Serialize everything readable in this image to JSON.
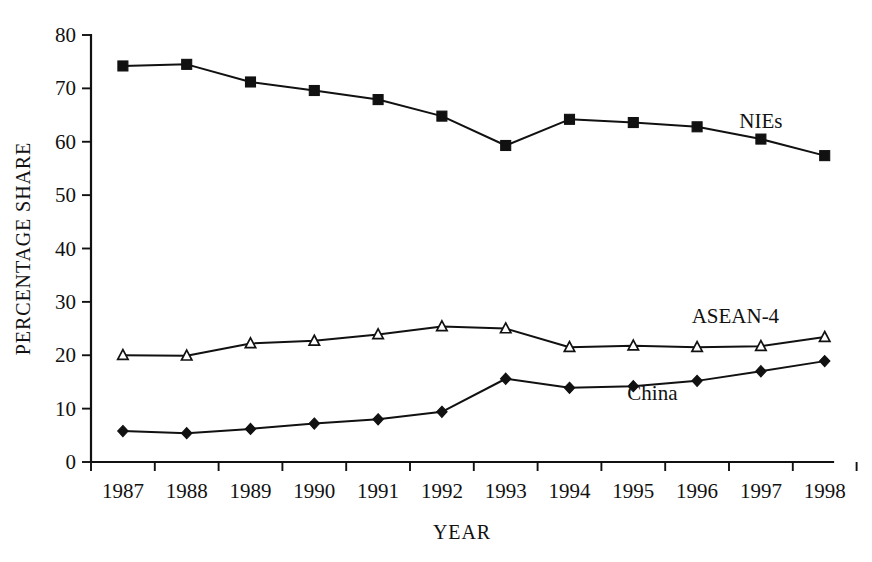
{
  "chart_data": {
    "type": "line",
    "title": "",
    "xlabel": "YEAR",
    "ylabel": "PERCENTAGE SHARE",
    "categories": [
      "1987",
      "1988",
      "1989",
      "1990",
      "1991",
      "1992",
      "1993",
      "1994",
      "1995",
      "1996",
      "1997",
      "1998"
    ],
    "x": [
      1987,
      1988,
      1989,
      1990,
      1991,
      1992,
      1993,
      1994,
      1995,
      1996,
      1997,
      1998
    ],
    "ylim": [
      0,
      80
    ],
    "yticks": [
      "0",
      "10",
      "20",
      "30",
      "40",
      "50",
      "60",
      "70",
      "80"
    ],
    "ytick_values": [
      0,
      10,
      20,
      30,
      40,
      50,
      60,
      70,
      80
    ],
    "grid": false,
    "legend_position": "inline-right",
    "series": [
      {
        "name": "NIEs",
        "marker": "filled-square",
        "values": [
          74.2,
          74.5,
          71.2,
          69.6,
          67.9,
          64.8,
          59.3,
          64.2,
          63.6,
          62.8,
          60.5,
          57.4
        ]
      },
      {
        "name": "ASEAN-4",
        "marker": "open-triangle",
        "values": [
          20.0,
          19.9,
          22.2,
          22.7,
          23.9,
          25.4,
          25.0,
          21.5,
          21.8,
          21.5,
          21.7,
          23.4
        ]
      },
      {
        "name": "China",
        "marker": "filled-diamond",
        "values": [
          5.8,
          5.4,
          6.2,
          7.2,
          8.0,
          9.4,
          15.6,
          13.9,
          14.2,
          15.2,
          17.0,
          18.9
        ]
      }
    ],
    "annotations": [
      {
        "text": "NIEs",
        "x": 1997.0,
        "y": 62.6
      },
      {
        "text": "ASEAN-4",
        "x": 1996.6,
        "y": 26.0
      },
      {
        "text": "China",
        "x": 1995.3,
        "y": 11.6
      }
    ],
    "colors": {
      "ink": "#111111",
      "background": "#ffffff"
    }
  }
}
